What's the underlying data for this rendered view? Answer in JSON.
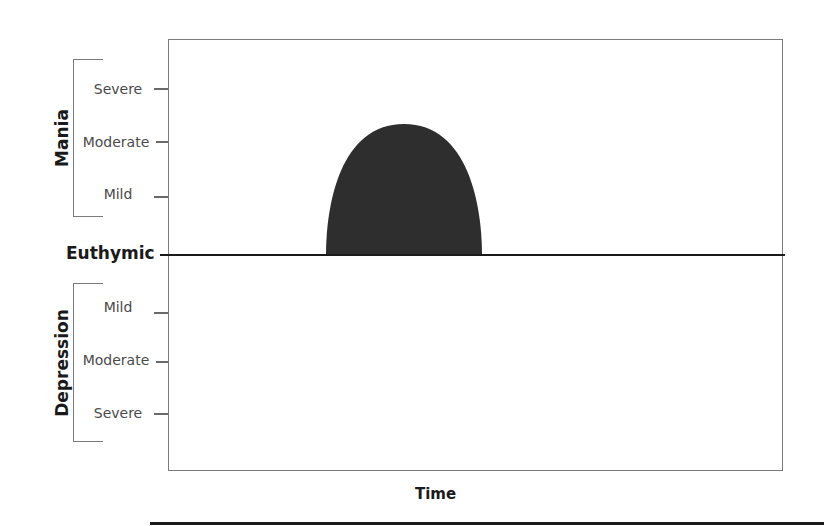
{
  "diagram": {
    "x_axis_label": "Time",
    "baseline_label": "Euthymic",
    "upper_group": {
      "label": "Mania",
      "levels": [
        "Severe",
        "Moderate",
        "Mild"
      ]
    },
    "lower_group": {
      "label": "Depression",
      "levels": [
        "Mild",
        "Moderate",
        "Severe"
      ]
    },
    "episode": {
      "type": "mania",
      "peak_level": "between Moderate and Severe",
      "fill_color": "#2e2e2e"
    },
    "colors": {
      "frame": "#7a7a7a",
      "baseline": "#1a1a1a",
      "text": "#4a4a4a"
    }
  }
}
